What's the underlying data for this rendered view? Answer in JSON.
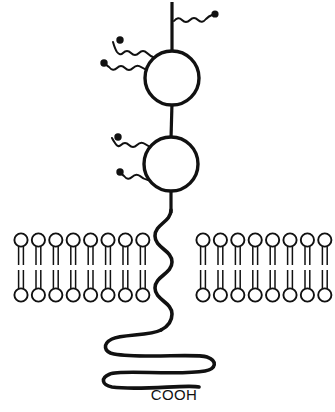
{
  "figure": {
    "background_color": "#ffffff",
    "line_color": "#111111",
    "width": 335,
    "height": 412
  },
  "labels": {
    "c_terminus": "COOH"
  },
  "extracellular_domains": [
    {
      "name": "upper-globular-domain",
      "shape": "circle",
      "cx": 172,
      "cy": 78,
      "r": 27
    },
    {
      "name": "lower-globular-domain",
      "shape": "circle",
      "cx": 171,
      "cy": 164,
      "r": 27
    }
  ],
  "stems": [
    {
      "name": "n-terminal-stem",
      "x1": 172,
      "y1": 2,
      "x2": 172,
      "y2": 51
    },
    {
      "name": "interdomain-linker",
      "x1": 172,
      "y1": 105,
      "x2": 171,
      "y2": 137
    },
    {
      "name": "domain-to-membrane-stem",
      "x1": 171,
      "y1": 191,
      "x2": 171,
      "y2": 212
    }
  ],
  "glycans": [
    {
      "name": "glycan-chain-top-right",
      "attached_to": "n-terminal-stem",
      "direction": "right",
      "start_x": 174,
      "start_y": 20,
      "end_x": 213,
      "end_y": 15,
      "waves": 3,
      "terminus": {
        "cx": 215,
        "cy": 14,
        "r": 3.4
      }
    },
    {
      "name": "glycan-chain-upper-left-a",
      "attached_to": "upper-globular-domain",
      "direction": "left",
      "start_x": 152,
      "start_y": 57,
      "end_x": 123,
      "end_y": 41,
      "waves": 4,
      "terminus": {
        "cx": 120,
        "cy": 40,
        "r": 3.6
      }
    },
    {
      "name": "glycan-chain-upper-left-b",
      "attached_to": "upper-globular-domain",
      "direction": "left",
      "start_x": 147,
      "start_y": 69,
      "end_x": 108,
      "end_y": 63,
      "waves": 4,
      "terminus": {
        "cx": 104,
        "cy": 63,
        "r": 3.6
      }
    },
    {
      "name": "glycan-chain-lower-left-a",
      "attached_to": "lower-globular-domain",
      "direction": "left",
      "start_x": 151,
      "start_y": 147,
      "end_x": 122,
      "end_y": 138,
      "waves": 4,
      "terminus": {
        "cx": 118,
        "cy": 137,
        "r": 3.6
      }
    },
    {
      "name": "glycan-chain-lower-left-b",
      "attached_to": "lower-globular-domain",
      "direction": "left",
      "start_x": 146,
      "start_y": 179,
      "end_x": 124,
      "end_y": 173,
      "waves": 3,
      "terminus": {
        "cx": 120,
        "cy": 172,
        "r": 3.6
      }
    }
  ],
  "membrane": {
    "name": "lipid-bilayer",
    "outer_leaflet_head_cy": 240,
    "inner_leaflet_head_cy": 295,
    "head_radius": 6.6,
    "tail_top_y": 247,
    "tail_bottom_y": 288,
    "tail_gap_half": 3,
    "left_patch": {
      "name": "membrane-patch-left",
      "x_start": 21,
      "spacing": 17.4,
      "count": 8
    },
    "right_patch": {
      "name": "membrane-patch-right",
      "x_start": 203,
      "spacing": 17.4,
      "count": 8
    }
  },
  "transmembrane_segment": {
    "name": "transmembrane-serpentine",
    "path": "M 171 210 C 171 222 155 224 155 236 C 155 248 172 250 172 262 C 172 274 155 276 155 288 C 155 300 172 302 172 314 C 172 322 166 326 160 330",
    "description": "vertical serpentine crossing the bilayer"
  },
  "cytoplasmic_tail": {
    "name": "cytoplasmic-coil",
    "path": "M 160 330 C 150 336 120 336 110 340 C 100 344 102 352 112 354 C 140 358 196 354 208 358 C 218 361 216 369 206 371 C 178 375 120 370 110 374 C 101 377 103 384 113 386 C 140 390 190 385 200 388",
    "description": "horizontal serpentine ending at the C-terminus"
  },
  "c_terminus_marker": {
    "name": "c-terminus-label-position",
    "x": 174,
    "y": 399
  }
}
